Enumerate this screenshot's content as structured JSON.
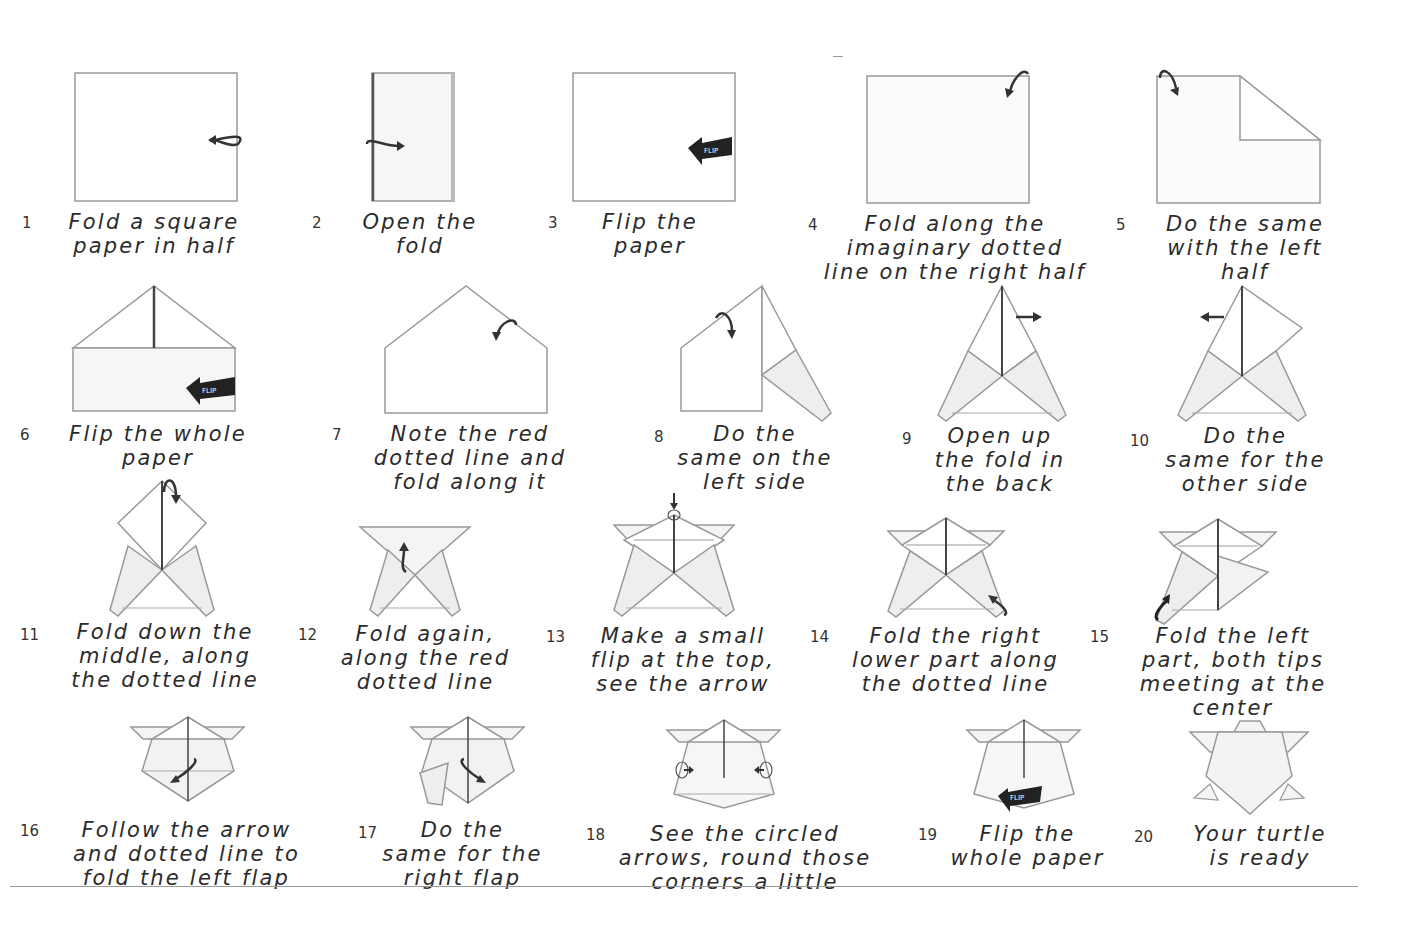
{
  "steps": [
    {
      "n": "1",
      "text": "Fold a square\npaper in half"
    },
    {
      "n": "2",
      "text": "Open the\nfold"
    },
    {
      "n": "3",
      "text": "Flip the\npaper"
    },
    {
      "n": "4",
      "text": "Fold along the\nimaginary dotted\nline on the right half"
    },
    {
      "n": "5",
      "text": "Do the same\nwith the left\nhalf"
    },
    {
      "n": "6",
      "text": "Flip the whole\npaper"
    },
    {
      "n": "7",
      "text": "Note the red\ndotted line and\nfold along it"
    },
    {
      "n": "8",
      "text": "Do the\nsame on the\nleft side"
    },
    {
      "n": "9",
      "text": "Open up\nthe fold in\nthe back"
    },
    {
      "n": "10",
      "text": "Do the\nsame for the\nother side"
    },
    {
      "n": "11",
      "text": "Fold down the\nmiddle, along\nthe dotted line"
    },
    {
      "n": "12",
      "text": "Fold again,\nalong the red\ndotted line"
    },
    {
      "n": "13",
      "text": "Make a small\nflip at the top,\nsee the arrow"
    },
    {
      "n": "14",
      "text": "Fold the right\nlower part along\nthe dotted line"
    },
    {
      "n": "15",
      "text": "Fold the left\npart, both tips\nmeeting at the\ncenter"
    },
    {
      "n": "16",
      "text": "Follow the arrow\nand dotted line to\nfold the left flap"
    },
    {
      "n": "17",
      "text": "Do the\nsame for the\nright flap"
    },
    {
      "n": "18",
      "text": "See the circled\narrows, round those\ncorners a little"
    },
    {
      "n": "19",
      "text": "Flip the\nwhole paper"
    },
    {
      "n": "20",
      "text": "Your turtle\nis ready"
    }
  ],
  "flip_label": "FLIP",
  "colors": {
    "line": "#8a8a8a",
    "shade": "#eeeeee",
    "arrow": "#333333"
  }
}
